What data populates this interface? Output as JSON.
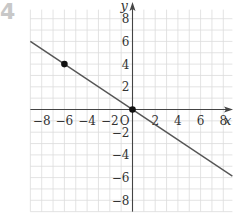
{
  "problem_number": "4",
  "colors": {
    "grid": "#dcdcdc",
    "axis": "#444444",
    "line": "#555555",
    "point": "#111111",
    "text": "#333333",
    "problem_number": "#c8c8c8"
  },
  "chart_data": {
    "type": "line",
    "title": "",
    "xlabel": "x",
    "ylabel": "y",
    "origin_label": "O",
    "xlim": [
      -9,
      8.8
    ],
    "ylim": [
      -9,
      8.8
    ],
    "grid": true,
    "x_ticks": [
      -8,
      -6,
      -4,
      -2,
      2,
      4,
      6,
      8
    ],
    "x_tick_labels": [
      "−8",
      "−6",
      "−4",
      "−2",
      "2",
      "4",
      "6",
      "8"
    ],
    "y_ticks": [
      8,
      6,
      4,
      2,
      -2,
      -4,
      -6,
      -8
    ],
    "y_tick_labels": [
      "8",
      "6",
      "4",
      "2",
      "−2",
      "−4",
      "−6",
      "−8"
    ],
    "series": [
      {
        "name": "y = -2/3 x",
        "equation": "y = -2/3 x",
        "x": [
          -9,
          8.8
        ],
        "y": [
          6,
          -5.87
        ]
      }
    ],
    "points": [
      {
        "x": -6,
        "y": 4,
        "label": ""
      },
      {
        "x": 0,
        "y": 0,
        "label": ""
      }
    ]
  }
}
